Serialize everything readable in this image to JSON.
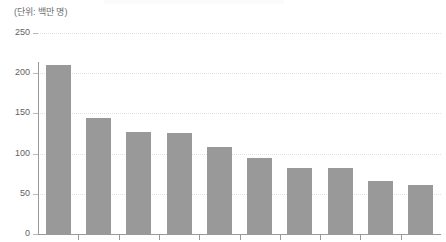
{
  "chart_data": {
    "type": "bar",
    "title": "",
    "subtitle": "",
    "unit_label": "(단위: 백만 명)",
    "xlabel": "",
    "ylabel": "",
    "ylim": [
      0,
      250
    ],
    "yticks": [
      0,
      50,
      100,
      150,
      200,
      250
    ],
    "ytick_labels": [
      "0",
      "50",
      "100",
      "150",
      "200",
      "250"
    ],
    "grid": true,
    "grid_style": "dotted",
    "legend": false,
    "legend_position": "none",
    "bar_color": "#999999",
    "axis_color": "#9a9a9a",
    "grid_color": "#e2e2e4",
    "categories": [
      "",
      "",
      "",
      "",
      "",
      "",
      "",
      "",
      "",
      ""
    ],
    "values": [
      210,
      144,
      127,
      126,
      108,
      95,
      82,
      82,
      66,
      61
    ]
  },
  "title_remnant": ""
}
